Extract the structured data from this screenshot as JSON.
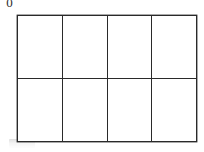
{
  "figure": {
    "background_color": "#ffffff",
    "line_color": "#2a2a2a",
    "line_width_px": 1.6,
    "corner_glyph": "0",
    "smudge_label": "",
    "grid": {
      "columns": 4,
      "rows": 2,
      "total_cells": 8,
      "origin_x_px": 17,
      "origin_y_px": 15,
      "width_px": 180,
      "height_px": 124,
      "column_width_px": 45,
      "row_height_px": 62,
      "vertical_divider_x_px": [
        62,
        107,
        152
      ],
      "horizontal_divider_y_px": [
        77
      ],
      "cells": [
        {
          "row": 0,
          "col": 0,
          "label": ""
        },
        {
          "row": 0,
          "col": 1,
          "label": ""
        },
        {
          "row": 0,
          "col": 2,
          "label": ""
        },
        {
          "row": 0,
          "col": 3,
          "label": ""
        },
        {
          "row": 1,
          "col": 0,
          "label": ""
        },
        {
          "row": 1,
          "col": 1,
          "label": ""
        },
        {
          "row": 1,
          "col": 2,
          "label": ""
        },
        {
          "row": 1,
          "col": 3,
          "label": ""
        }
      ]
    }
  }
}
